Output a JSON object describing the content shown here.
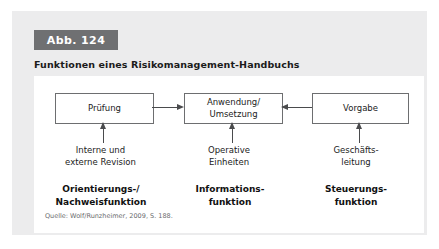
{
  "figure": {
    "badge": "Abb. 124",
    "title": "Funktionen eines Risikomanagement-Handbuchs",
    "source_note": "Quelle: Wolf/Runzheimer, 2009, S. 188.",
    "badge_color": "#6f7072",
    "card_color": "#ececed",
    "panel_color": "#ffffff",
    "line_color": "#6d6e70"
  },
  "diagram": {
    "type": "flow",
    "nodes": [
      {
        "id": "pruefung",
        "label": "Prüfung"
      },
      {
        "id": "anwendung",
        "label": "Anwendung/\nUmsetzung"
      },
      {
        "id": "vorgabe",
        "label": "Vorgabe"
      }
    ],
    "edges": [
      {
        "from": "pruefung",
        "to": "anwendung",
        "direction": "right"
      },
      {
        "from": "vorgabe",
        "to": "anwendung",
        "direction": "left"
      },
      {
        "from": "interne-externe-revision",
        "to": "pruefung",
        "direction": "up"
      },
      {
        "from": "operative-einheiten",
        "to": "anwendung",
        "direction": "up"
      },
      {
        "from": "geschaeftsleitung",
        "to": "vorgabe",
        "direction": "up"
      }
    ],
    "sources": [
      {
        "id": "interne-externe-revision",
        "label": "Interne und\nexterne Revision"
      },
      {
        "id": "operative-einheiten",
        "label": "Operative\nEinheiten"
      },
      {
        "id": "geschaeftsleitung",
        "label": "Geschäfts-\nleitung"
      }
    ],
    "functions": [
      {
        "id": "orientierung",
        "label": "Orientierungs-/\nNachweisfunktion"
      },
      {
        "id": "information",
        "label": "Informations-\nfunktion"
      },
      {
        "id": "steuerung",
        "label": "Steuerungs-\nfunktion"
      }
    ]
  }
}
